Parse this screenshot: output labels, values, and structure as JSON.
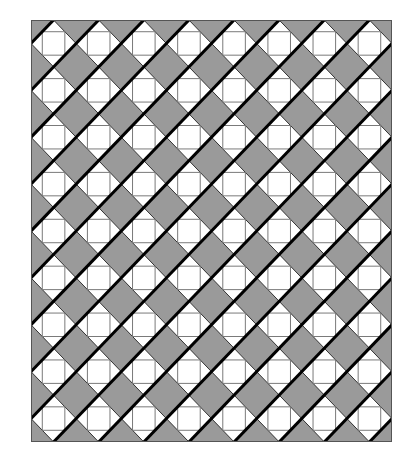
{
  "quilt": {
    "columns": 8,
    "rows": 9,
    "width": 361,
    "height": 422,
    "colors": {
      "background_gray": "#9a9a9a",
      "diamond_white": "#ffffff",
      "thick_stripe": "#000000",
      "thin_edge": "#333333",
      "inner_square_outline": "#7a7a7a",
      "border": "#555555"
    },
    "block": {
      "shape": "white diamond on gray with inner square",
      "inner_square_inset": 0.25,
      "stripe_direction": "diagonal-up-right"
    }
  }
}
